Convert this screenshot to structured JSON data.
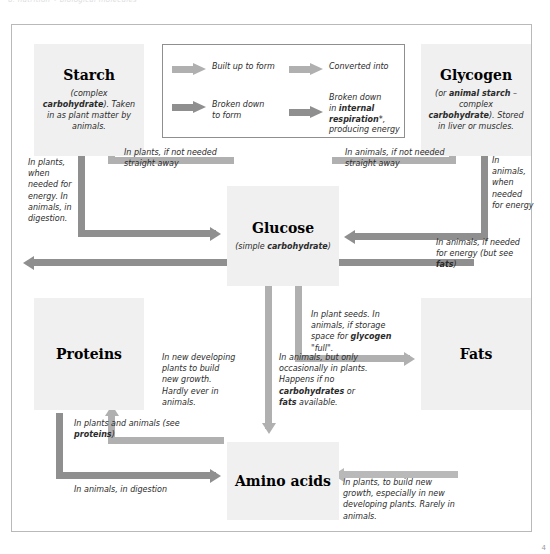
{
  "page": {
    "top_cut_text": "6. nutrition  •  biological molecules",
    "page_number": "4"
  },
  "colors": {
    "arrow_built_up": "#b0b0b0",
    "arrow_broken_down": "#8f8f8f",
    "arrow_converted": "#b0b0b0",
    "arrow_respiration": "#8f8f8f",
    "box_fill": "#f0f0f0",
    "frame_border": "#b9b9b9"
  },
  "boxes": {
    "starch": {
      "title": "Starch",
      "sub_html": "(complex <b>carbohydrate</b>). Taken in as plant matter by animals."
    },
    "glycogen": {
      "title": "Glycogen",
      "sub_html": "(or <b>animal starch</b> &ndash; complex <b>carbohydrate</b>). Stored in liver or muscles."
    },
    "glucose": {
      "title": "Glucose",
      "sub_html": "(simple <b>carbohydrate</b>)"
    },
    "proteins": {
      "title": "Proteins",
      "sub_html": ""
    },
    "fats": {
      "title": "Fats",
      "sub_html": ""
    },
    "amino": {
      "title": "Amino acids",
      "sub_html": ""
    }
  },
  "legend": {
    "items": [
      {
        "key": "built_up",
        "label_html": "Built up to form",
        "arrow_color": "#b0b0b0"
      },
      {
        "key": "broken_down",
        "label_html": "Broken down<br>to form",
        "arrow_color": "#8f8f8f"
      },
      {
        "key": "converted",
        "label_html": "Converted into",
        "arrow_color": "#b0b0b0"
      },
      {
        "key": "respiration",
        "label_html": "Broken down<br>in <b>internal</b><br><b>respiration</b>*,<br>producing energy",
        "arrow_color": "#8f8f8f"
      }
    ]
  },
  "captions": {
    "starch_to_glucose_left": "In plants, when needed for energy. In animals, in digestion.",
    "glucose_to_starch": "In plants, if not needed straight away",
    "glucose_to_glycogen": "In animals, if not needed straight away",
    "glycogen_to_glucose": "In animals, when needed for energy",
    "glucose_respiration": "In animals, if needed for energy (but see <b>fats</b>)",
    "glucose_to_fats": "In plant seeds. In animals, if storage space for <b>glycogen</b> \"full\".",
    "amino_to_proteins": "In plants and animals (see <b>proteins</b>)",
    "proteins_to_amino": "In animals, in digestion",
    "amino_to_glucose": "In new developing plants to build new growth. Hardly ever in animals.",
    "glucose_to_amino": "In animals, but only occasionally in plants. Happens if no <b>carbohydrates</b> or <b>fats</b> available.",
    "fats_to_amino": "In plants, to build new growth, especially in new developing plants. Rarely in animals."
  }
}
